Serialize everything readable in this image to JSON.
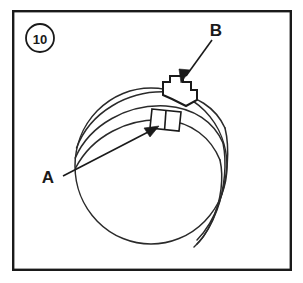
{
  "figure": {
    "number_badge": "10",
    "frame": {
      "x": 12,
      "y": 10,
      "width": 280,
      "height": 261,
      "stroke_color": "#1a1a1a",
      "background_color": "#ffffff"
    },
    "drawing_type": "technical-line-drawing",
    "line_color": "#2a2a2a",
    "fill_color": "#ffffff"
  },
  "callouts": [
    {
      "label": "A",
      "label_x": 48,
      "label_y": 177,
      "target": "buckle",
      "leader_from_x": 63,
      "leader_from_y": 176,
      "leader_to_x": 157,
      "leader_to_y": 126
    },
    {
      "label": "B",
      "label_x": 216,
      "label_y": 30,
      "target": "top-tab",
      "leader_from_x": 212,
      "leader_from_y": 40,
      "leader_to_x": 181,
      "leader_to_y": 82
    }
  ],
  "geometry": {
    "sphere": {
      "cx": 151,
      "cy": 166,
      "rx": 76,
      "ry": 78
    },
    "badge": {
      "cx": 40,
      "cy": 38,
      "r": 14
    }
  }
}
